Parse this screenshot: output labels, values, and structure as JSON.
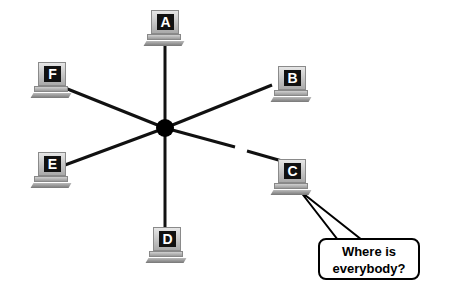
{
  "diagram": {
    "type": "star-topology",
    "hub": {
      "x": 165,
      "y": 128
    },
    "nodes": [
      {
        "label": "A",
        "x": 145,
        "y": 10
      },
      {
        "label": "B",
        "x": 272,
        "y": 66
      },
      {
        "label": "C",
        "x": 272,
        "y": 159
      },
      {
        "label": "D",
        "x": 147,
        "y": 227
      },
      {
        "label": "E",
        "x": 32,
        "y": 152
      },
      {
        "label": "F",
        "x": 32,
        "y": 62
      }
    ],
    "broken_link": "C",
    "callout": {
      "text_line1": "Where is",
      "text_line2": "everybody?"
    }
  }
}
